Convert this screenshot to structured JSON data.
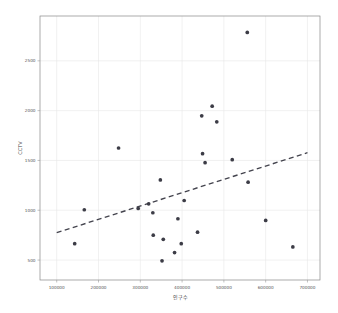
{
  "chart_data": {
    "type": "scatter",
    "title": "",
    "xlabel": "인구수",
    "ylabel": "CCTV",
    "xlim": [
      60000,
      730000
    ],
    "ylim": [
      300,
      2950
    ],
    "xticks": [
      100000,
      200000,
      300000,
      400000,
      500000,
      600000,
      700000
    ],
    "xticklabels": [
      "100000",
      "200000",
      "300000",
      "400000",
      "500000",
      "600000",
      "700000"
    ],
    "yticks": [
      500,
      1000,
      1500,
      2000,
      2500
    ],
    "yticklabels": [
      "500",
      "1000",
      "1500",
      "2000",
      "2500"
    ],
    "grid": true,
    "legend": null,
    "marker_color": "#3c3c46",
    "trendline_color": "#43434d",
    "points": [
      {
        "x": 143000,
        "y": 665
      },
      {
        "x": 166000,
        "y": 1005
      },
      {
        "x": 248000,
        "y": 1625
      },
      {
        "x": 295000,
        "y": 1018
      },
      {
        "x": 320000,
        "y": 1065
      },
      {
        "x": 330000,
        "y": 975
      },
      {
        "x": 331000,
        "y": 750
      },
      {
        "x": 348000,
        "y": 1305
      },
      {
        "x": 352000,
        "y": 492
      },
      {
        "x": 355000,
        "y": 708
      },
      {
        "x": 382000,
        "y": 575
      },
      {
        "x": 390000,
        "y": 915
      },
      {
        "x": 398000,
        "y": 665
      },
      {
        "x": 405000,
        "y": 1098
      },
      {
        "x": 437000,
        "y": 780
      },
      {
        "x": 447000,
        "y": 1948
      },
      {
        "x": 449000,
        "y": 1568
      },
      {
        "x": 455000,
        "y": 1478
      },
      {
        "x": 472000,
        "y": 2045
      },
      {
        "x": 483000,
        "y": 1888
      },
      {
        "x": 520000,
        "y": 1508
      },
      {
        "x": 556000,
        "y": 2785
      },
      {
        "x": 558000,
        "y": 1282
      },
      {
        "x": 600000,
        "y": 898
      },
      {
        "x": 665000,
        "y": 632
      }
    ],
    "trendline": {
      "style": "dashed",
      "x_start": 100000,
      "y_start": 775,
      "x_end": 700000,
      "y_end": 1578
    }
  }
}
